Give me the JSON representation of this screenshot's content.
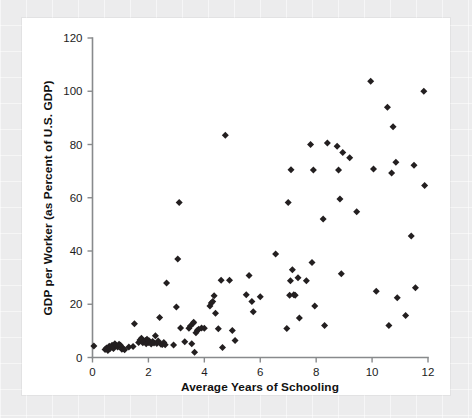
{
  "figure": {
    "background_color": "#ececed",
    "panel_color": "#ffffff",
    "marker_color": "#231f20",
    "axis_color": "#888a8c"
  },
  "chart_data": {
    "type": "scatter",
    "title": "",
    "xlabel": "Average Years of Schooling",
    "ylabel": "GDP per Worker (as Percent of U.S. GDP)",
    "xlim": [
      0,
      12
    ],
    "ylim": [
      0,
      120
    ],
    "xticks": [
      0,
      2,
      4,
      6,
      8,
      10,
      12
    ],
    "yticks": [
      0,
      20,
      40,
      60,
      80,
      100,
      120
    ],
    "xtick_labels": [
      "0",
      "2",
      "4",
      "6",
      "8",
      "10",
      "12"
    ],
    "ytick_labels": [
      "0",
      "20",
      "40",
      "60",
      "80",
      "100",
      "120"
    ],
    "grid": false,
    "legend": null,
    "marker_shape": "diamond",
    "n_points": 112,
    "points": [
      [
        0.05,
        4.3
      ],
      [
        0.45,
        3.0
      ],
      [
        0.5,
        3.6
      ],
      [
        0.55,
        2.6
      ],
      [
        0.6,
        4.2
      ],
      [
        0.62,
        3.3
      ],
      [
        0.7,
        4.6
      ],
      [
        0.75,
        3.4
      ],
      [
        0.8,
        5.2
      ],
      [
        0.85,
        4.4
      ],
      [
        0.9,
        3.9
      ],
      [
        0.95,
        5.0
      ],
      [
        1.0,
        4.6
      ],
      [
        1.05,
        3.1
      ],
      [
        1.1,
        3.4
      ],
      [
        1.15,
        2.9
      ],
      [
        1.3,
        3.9
      ],
      [
        1.45,
        4.1
      ],
      [
        1.5,
        12.7
      ],
      [
        1.65,
        5.6
      ],
      [
        1.7,
        6.6
      ],
      [
        1.75,
        7.2
      ],
      [
        1.8,
        5.5
      ],
      [
        1.85,
        6.1
      ],
      [
        1.9,
        6.4
      ],
      [
        1.92,
        5.2
      ],
      [
        1.95,
        6.9
      ],
      [
        2.0,
        5.6
      ],
      [
        2.02,
        6.3
      ],
      [
        2.05,
        5.8
      ],
      [
        2.1,
        5.1
      ],
      [
        2.15,
        6.0
      ],
      [
        2.2,
        5.4
      ],
      [
        2.25,
        8.2
      ],
      [
        2.3,
        5.3
      ],
      [
        2.35,
        6.2
      ],
      [
        2.4,
        15.0
      ],
      [
        2.45,
        5.0
      ],
      [
        2.5,
        4.9
      ],
      [
        2.55,
        5.6
      ],
      [
        2.6,
        4.8
      ],
      [
        2.65,
        28.0
      ],
      [
        2.9,
        4.7
      ],
      [
        3.0,
        19.0
      ],
      [
        3.05,
        37.0
      ],
      [
        3.1,
        58.2
      ],
      [
        3.15,
        11.1
      ],
      [
        3.3,
        5.9
      ],
      [
        3.45,
        11.0
      ],
      [
        3.5,
        11.8
      ],
      [
        3.55,
        5.2
      ],
      [
        3.6,
        12.9
      ],
      [
        3.62,
        13.2
      ],
      [
        3.65,
        2.0
      ],
      [
        3.7,
        9.3
      ],
      [
        3.75,
        10.2
      ],
      [
        3.8,
        10.6
      ],
      [
        3.9,
        11.1
      ],
      [
        4.0,
        11.0
      ],
      [
        4.2,
        19.3
      ],
      [
        4.25,
        20.5
      ],
      [
        4.3,
        21.0
      ],
      [
        4.35,
        23.2
      ],
      [
        4.4,
        16.6
      ],
      [
        4.5,
        10.8
      ],
      [
        4.6,
        29.0
      ],
      [
        4.65,
        3.8
      ],
      [
        4.75,
        83.5
      ],
      [
        4.9,
        29.0
      ],
      [
        5.0,
        10.1
      ],
      [
        5.1,
        6.4
      ],
      [
        5.5,
        23.6
      ],
      [
        5.6,
        30.8
      ],
      [
        5.7,
        21.0
      ],
      [
        5.75,
        17.2
      ],
      [
        6.0,
        22.8
      ],
      [
        6.55,
        38.9
      ],
      [
        6.95,
        10.9
      ],
      [
        7.0,
        58.2
      ],
      [
        7.05,
        23.4
      ],
      [
        7.08,
        28.8
      ],
      [
        7.1,
        70.5
      ],
      [
        7.15,
        33.0
      ],
      [
        7.2,
        23.6
      ],
      [
        7.25,
        23.4
      ],
      [
        7.35,
        30.0
      ],
      [
        7.4,
        14.8
      ],
      [
        7.65,
        28.8
      ],
      [
        7.8,
        80.0
      ],
      [
        7.85,
        35.7
      ],
      [
        7.9,
        70.4
      ],
      [
        7.95,
        19.3
      ],
      [
        8.25,
        52.0
      ],
      [
        8.3,
        12.0
      ],
      [
        8.4,
        80.6
      ],
      [
        8.75,
        79.3
      ],
      [
        8.8,
        70.4
      ],
      [
        8.85,
        59.5
      ],
      [
        8.9,
        31.5
      ],
      [
        8.95,
        77.0
      ],
      [
        9.2,
        75.0
      ],
      [
        9.45,
        54.7
      ],
      [
        9.95,
        103.8
      ],
      [
        10.05,
        70.8
      ],
      [
        10.15,
        24.9
      ],
      [
        10.55,
        94.0
      ],
      [
        10.6,
        12.0
      ],
      [
        10.7,
        69.3
      ],
      [
        10.75,
        86.7
      ],
      [
        10.85,
        73.3
      ],
      [
        10.9,
        22.4
      ],
      [
        11.2,
        15.8
      ],
      [
        11.4,
        45.6
      ],
      [
        11.5,
        72.2
      ],
      [
        11.55,
        26.2
      ],
      [
        11.85,
        100.0
      ],
      [
        11.88,
        64.6
      ]
    ]
  }
}
